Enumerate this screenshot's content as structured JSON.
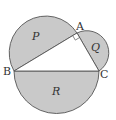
{
  "diagram": {
    "colors": {
      "fill": "#c9c9c9",
      "stroke": "#555555",
      "background": "#ffffff"
    },
    "points": {
      "A": {
        "label": "A",
        "x": 77,
        "y": 33
      },
      "B": {
        "label": "B",
        "x": 14,
        "y": 71
      },
      "C": {
        "label": "C",
        "x": 99,
        "y": 71
      }
    },
    "regions": {
      "P": {
        "label": "P"
      },
      "Q": {
        "label": "Q"
      },
      "R": {
        "label": "R"
      }
    },
    "right_angle_at": "A"
  }
}
